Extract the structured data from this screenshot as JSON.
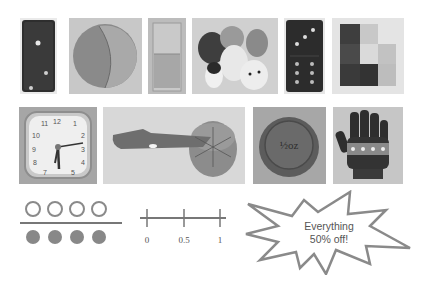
{
  "photos": {
    "row1": [
      {
        "name": "domino-1-2",
        "label": "Domino"
      },
      {
        "name": "ball",
        "label": "Ball"
      },
      {
        "name": "glass-of-water",
        "label": "Half-full glass"
      },
      {
        "name": "stuffed-animals",
        "label": "Stuffed animals"
      },
      {
        "name": "domino-3-6",
        "label": "Domino"
      },
      {
        "name": "blocks",
        "label": "Blocks"
      }
    ],
    "row2": [
      {
        "name": "clock",
        "label": "Clock",
        "numerals": [
          "11",
          "12",
          "1",
          "10",
          "2",
          "9",
          "3",
          "8",
          "4",
          "7",
          "5"
        ]
      },
      {
        "name": "apple-slicer",
        "label": "Apple and slicer"
      },
      {
        "name": "weight",
        "label": "Weight",
        "text": "½ oz"
      },
      {
        "name": "glove",
        "label": "Glove"
      }
    ]
  },
  "fraction_diagram": {
    "numerator_circles": 4,
    "denominator_circles": 4,
    "colors": {
      "outline": "#8a8a8a",
      "filled": "#888888",
      "bar": "#777777"
    }
  },
  "number_line": {
    "ticks": [
      "0",
      "0.5",
      "1"
    ],
    "color": "#777777"
  },
  "starburst": {
    "line1": "Everything",
    "line2": "50% off!",
    "stroke": "#888888"
  }
}
